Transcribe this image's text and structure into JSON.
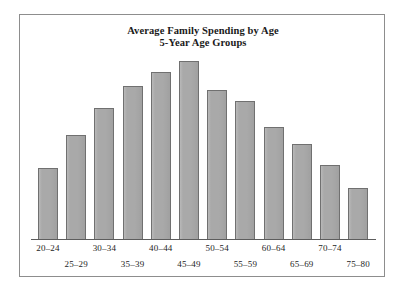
{
  "chart_data": {
    "type": "bar",
    "title": "Average Family Spending by Age",
    "subtitle": "5-Year Age Groups",
    "xlabel": "",
    "ylabel": "",
    "grid": false,
    "legend": false,
    "axis_style": "baseline-only",
    "tick_label_layout": "alternating-two-rows",
    "categories": [
      "20–24",
      "25–29",
      "30–34",
      "35–39",
      "40–44",
      "45–49",
      "50–54",
      "55–59",
      "60–64",
      "65–69",
      "70–74",
      "75–80"
    ],
    "values": [
      71,
      104,
      131,
      153,
      167,
      178,
      149,
      138,
      112,
      95,
      74,
      51
    ],
    "value_units": "relative bar height (px, unlabeled axis)",
    "ylim": [
      0,
      190
    ],
    "bar_fill_color": "#a9a9a9",
    "bar_border_color": "#707070",
    "axis_color": "#5d5d5d",
    "frame_color": "#8d8d8d",
    "background_color": "#ffffff"
  },
  "title": {
    "line1": "Average Family Spending by Age",
    "line2": "5-Year Age Groups"
  }
}
